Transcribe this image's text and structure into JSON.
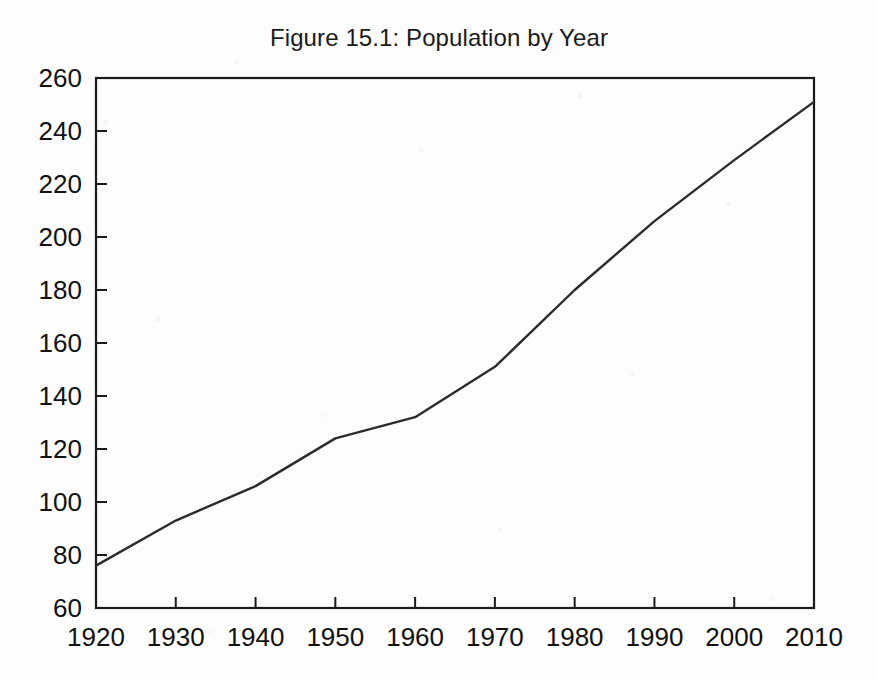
{
  "figure": {
    "title": "Figure 15.1: Population by Year",
    "background_color": "#fdfdfd",
    "line_color": "#2b2b2b",
    "axis_color": "#1a1a1a"
  },
  "chart_data": {
    "type": "line",
    "title": "Figure 15.1: Population by Year",
    "xlabel": "",
    "ylabel": "",
    "x": [
      1920,
      1930,
      1940,
      1950,
      1960,
      1970,
      1980,
      1990,
      2000,
      2010
    ],
    "values": [
      76,
      93,
      106,
      124,
      132,
      151,
      180,
      206,
      229,
      251
    ],
    "series": [
      {
        "name": "Population",
        "values": [
          76,
          93,
          106,
          124,
          132,
          151,
          180,
          206,
          229,
          251
        ]
      }
    ],
    "xlim": [
      1920,
      2010
    ],
    "ylim": [
      60,
      260
    ],
    "xticks": [
      1920,
      1930,
      1940,
      1950,
      1960,
      1970,
      1980,
      1990,
      2000,
      2010
    ],
    "yticks": [
      60,
      80,
      100,
      120,
      140,
      160,
      180,
      200,
      220,
      240,
      260
    ],
    "xtick_labels": [
      "1920",
      "1930",
      "1940",
      "1950",
      "1960",
      "1970",
      "1980",
      "1990",
      "2000",
      "2010"
    ],
    "ytick_labels": [
      "60",
      "80",
      "100",
      "120",
      "140",
      "160",
      "180",
      "200",
      "220",
      "240",
      "260"
    ],
    "grid": false,
    "legend": null,
    "legend_position": "none",
    "annotations": []
  }
}
